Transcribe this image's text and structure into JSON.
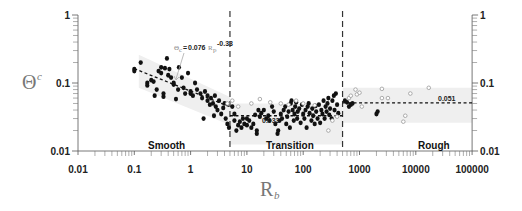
{
  "chart_data": {
    "type": "scatter",
    "title": "",
    "xlabel": "R_b",
    "xlabel_main": "R",
    "xlabel_sub": "b",
    "ylabel": "Θ_c",
    "ylabel_main": "Θ",
    "ylabel_sub": "c",
    "xscale": "log",
    "yscale": "log",
    "xlim": [
      0.01,
      100000
    ],
    "ylim": [
      0.01,
      1
    ],
    "grid": false,
    "x_ticks": [
      0.01,
      0.1,
      1,
      10,
      100,
      1000,
      10000,
      100000
    ],
    "x_tick_labels": [
      "0.01",
      "0.1",
      "1",
      "10",
      "100",
      "1000",
      "10000",
      "100000"
    ],
    "y_ticks": [
      0.01,
      0.1,
      1
    ],
    "y_tick_labels": [
      "0.01",
      "0.1",
      "1"
    ],
    "y_axis_both_sides": true,
    "regime_boundaries": [
      5,
      500
    ],
    "regimes": [
      {
        "label": "Smooth",
        "x_label_pos": 1.5
      },
      {
        "label": "Transition",
        "x_label_pos": 50
      },
      {
        "label": "Rough",
        "x_label_pos": 4000
      }
    ],
    "fits": [
      {
        "name": "smooth_fit",
        "equation": "Θc=0.076Rb^-0.33",
        "eq_prefix": "Θ",
        "eq_prefix_sub": "c",
        "eq_eq": "=",
        "eq_coef": "0.076",
        "eq_var": "R",
        "eq_var_sub": "p",
        "eq_exp": "-0.33",
        "x_range": [
          0.1,
          5
        ],
        "a": 0.076,
        "b": -0.33
      },
      {
        "name": "transition_mean",
        "label": "0.033",
        "x_range": [
          5,
          500
        ],
        "value": 0.033
      },
      {
        "name": "rough_mean",
        "label": "0.051",
        "x_range": [
          500,
          100000
        ],
        "value": 0.051
      }
    ],
    "bands": [
      {
        "regime": "Smooth",
        "polygon": [
          [
            0.12,
            0.26
          ],
          [
            5,
            0.062
          ],
          [
            5,
            0.024
          ],
          [
            0.12,
            0.085
          ]
        ]
      },
      {
        "regime": "Transition",
        "polygon": [
          [
            5,
            0.05
          ],
          [
            500,
            0.05
          ],
          [
            500,
            0.0125
          ],
          [
            5,
            0.0125
          ]
        ]
      },
      {
        "regime": "Rough",
        "polygon": [
          [
            500,
            0.085
          ],
          [
            100000,
            0.085
          ],
          [
            100000,
            0.026
          ],
          [
            500,
            0.026
          ]
        ]
      }
    ],
    "series": [
      {
        "name": "filled",
        "marker": "filled-circle",
        "color": "#111111",
        "points": [
          [
            0.1,
            0.16
          ],
          [
            0.1,
            0.15
          ],
          [
            0.13,
            0.2
          ],
          [
            0.17,
            0.1
          ],
          [
            0.17,
            0.092
          ],
          [
            0.2,
            0.11
          ],
          [
            0.22,
            0.105
          ],
          [
            0.23,
            0.065
          ],
          [
            0.25,
            0.08
          ],
          [
            0.27,
            0.15
          ],
          [
            0.3,
            0.17
          ],
          [
            0.3,
            0.14
          ],
          [
            0.33,
            0.07
          ],
          [
            0.33,
            0.063
          ],
          [
            0.35,
            0.165
          ],
          [
            0.38,
            0.23
          ],
          [
            0.4,
            0.13
          ],
          [
            0.42,
            0.16
          ],
          [
            0.45,
            0.12
          ],
          [
            0.5,
            0.095
          ],
          [
            0.5,
            0.1
          ],
          [
            0.55,
            0.058
          ],
          [
            0.6,
            0.08
          ],
          [
            0.62,
            0.17
          ],
          [
            0.7,
            0.12
          ],
          [
            0.75,
            0.085
          ],
          [
            0.8,
            0.07
          ],
          [
            0.9,
            0.14
          ],
          [
            1.0,
            0.075
          ],
          [
            1.0,
            0.07
          ],
          [
            1.1,
            0.065
          ],
          [
            1.2,
            0.1
          ],
          [
            1.3,
            0.08
          ],
          [
            1.5,
            0.07
          ],
          [
            1.6,
            0.06
          ],
          [
            1.8,
            0.075
          ],
          [
            2.0,
            0.055
          ],
          [
            2.0,
            0.065
          ],
          [
            2.2,
            0.048
          ],
          [
            2.3,
            0.06
          ],
          [
            2.5,
            0.05
          ],
          [
            2.7,
            0.065
          ],
          [
            2.8,
            0.045
          ],
          [
            3.0,
            0.04
          ],
          [
            3.2,
            0.055
          ],
          [
            3.5,
            0.035
          ],
          [
            4.0,
            0.05
          ],
          [
            4.2,
            0.03
          ],
          [
            4.5,
            0.025
          ],
          [
            4.8,
            0.022
          ],
          [
            1.7,
            0.03
          ],
          [
            2.6,
            0.033
          ],
          [
            3.8,
            0.043
          ],
          [
            5.5,
            0.045
          ],
          [
            6,
            0.035
          ],
          [
            6,
            0.028
          ],
          [
            6.5,
            0.02
          ],
          [
            7,
            0.024
          ],
          [
            7.5,
            0.027
          ],
          [
            8,
            0.022
          ],
          [
            8.5,
            0.03
          ],
          [
            9,
            0.025
          ],
          [
            10,
            0.024
          ],
          [
            10,
            0.03
          ],
          [
            11,
            0.028
          ],
          [
            12,
            0.022
          ],
          [
            13,
            0.025
          ],
          [
            14,
            0.034
          ],
          [
            15,
            0.018
          ],
          [
            15,
            0.02
          ],
          [
            16,
            0.04
          ],
          [
            17,
            0.032
          ],
          [
            18,
            0.036
          ],
          [
            20,
            0.04
          ],
          [
            22,
            0.03
          ],
          [
            24,
            0.033
          ],
          [
            25,
            0.028
          ],
          [
            28,
            0.045
          ],
          [
            30,
            0.038
          ],
          [
            32,
            0.025
          ],
          [
            35,
            0.018
          ],
          [
            36,
            0.02
          ],
          [
            38,
            0.028
          ],
          [
            40,
            0.035
          ],
          [
            42,
            0.03
          ],
          [
            45,
            0.04
          ],
          [
            48,
            0.045
          ],
          [
            50,
            0.025
          ],
          [
            52,
            0.032
          ],
          [
            55,
            0.038
          ],
          [
            58,
            0.022
          ],
          [
            60,
            0.05
          ],
          [
            62,
            0.055
          ],
          [
            65,
            0.04
          ],
          [
            68,
            0.028
          ],
          [
            70,
            0.035
          ],
          [
            72,
            0.045
          ],
          [
            75,
            0.052
          ],
          [
            78,
            0.03
          ],
          [
            80,
            0.038
          ],
          [
            85,
            0.042
          ],
          [
            90,
            0.026
          ],
          [
            95,
            0.048
          ],
          [
            100,
            0.035
          ],
          [
            105,
            0.03
          ],
          [
            110,
            0.04
          ],
          [
            115,
            0.022
          ],
          [
            120,
            0.045
          ],
          [
            125,
            0.05
          ],
          [
            130,
            0.036
          ],
          [
            140,
            0.028
          ],
          [
            145,
            0.042
          ],
          [
            150,
            0.033
          ],
          [
            160,
            0.025
          ],
          [
            165,
            0.046
          ],
          [
            170,
            0.038
          ],
          [
            180,
            0.03
          ],
          [
            190,
            0.048
          ],
          [
            200,
            0.026
          ],
          [
            210,
            0.04
          ],
          [
            220,
            0.035
          ],
          [
            230,
            0.055
          ],
          [
            240,
            0.03
          ],
          [
            250,
            0.045
          ],
          [
            260,
            0.038
          ],
          [
            270,
            0.05
          ],
          [
            280,
            0.06
          ],
          [
            290,
            0.034
          ],
          [
            300,
            0.042
          ],
          [
            320,
            0.03
          ],
          [
            330,
            0.055
          ],
          [
            350,
            0.065
          ],
          [
            360,
            0.04
          ],
          [
            380,
            0.07
          ],
          [
            400,
            0.048
          ],
          [
            420,
            0.036
          ],
          [
            550,
            0.055
          ],
          [
            600,
            0.052
          ],
          [
            650,
            0.045
          ],
          [
            700,
            0.048
          ],
          [
            750,
            0.05
          ],
          [
            2000,
            0.035
          ],
          [
            2100,
            0.038
          ]
        ]
      },
      {
        "name": "open",
        "marker": "open-diamond",
        "color": "#999999",
        "points": [
          [
            4.5,
            0.05
          ],
          [
            5.5,
            0.055
          ],
          [
            7,
            0.045
          ],
          [
            12,
            0.05
          ],
          [
            17,
            0.058
          ],
          [
            26,
            0.052
          ],
          [
            40,
            0.05
          ],
          [
            55,
            0.048
          ],
          [
            75,
            0.055
          ],
          [
            100,
            0.05
          ],
          [
            160,
            0.047
          ],
          [
            280,
            0.02
          ],
          [
            330,
            0.028
          ],
          [
            400,
            0.032
          ],
          [
            650,
            0.06
          ],
          [
            700,
            0.065
          ],
          [
            850,
            0.08
          ],
          [
            900,
            0.068
          ],
          [
            1000,
            0.072
          ],
          [
            1100,
            0.045
          ],
          [
            2500,
            0.082
          ],
          [
            2500,
            0.06
          ],
          [
            3200,
            0.06
          ],
          [
            6000,
            0.027
          ],
          [
            6500,
            0.033
          ],
          [
            8000,
            0.07
          ],
          [
            17000,
            0.085
          ]
        ]
      }
    ]
  }
}
